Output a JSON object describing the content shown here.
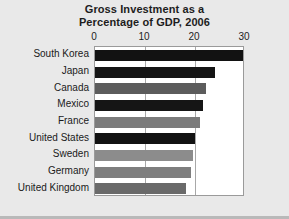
{
  "chart_data": {
    "type": "bar",
    "orientation": "horizontal",
    "title": "Gross Investment as a Percentage of GDP, 2006",
    "title_lines": [
      "Gross Investment as a",
      "Percentage of GDP, 2006"
    ],
    "xlabel": "",
    "ylabel": "",
    "xlim": [
      0,
      30
    ],
    "ylim": null,
    "xticks": [
      0,
      10,
      20,
      30
    ],
    "xtick_labels": [
      "0",
      "10",
      "20",
      "30"
    ],
    "grid": "vertical",
    "legend": "none",
    "categories": [
      "South Korea",
      "Japan",
      "Canada",
      "Mexico",
      "France",
      "United States",
      "Sweden",
      "Germany",
      "United Kingdom"
    ],
    "values": [
      29.5,
      24.0,
      22.2,
      21.5,
      21.0,
      20.0,
      19.5,
      19.2,
      18.2
    ],
    "bar_colors": [
      "#121212",
      "#151515",
      "#5c5c5c",
      "#151515",
      "#7b7b7b",
      "#121212",
      "#8c8c8c",
      "#7e7e7e",
      "#6a6a6a"
    ]
  },
  "colors": {
    "figure_background": "#e9e9e9",
    "plot_background": "#ffffff",
    "plot_border": "#9a9a9a",
    "gridline": "#a8a8a8",
    "text": "#1d1d1d"
  }
}
